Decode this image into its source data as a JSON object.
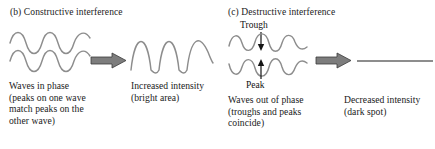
{
  "figure": {
    "panels": [
      {
        "id": "constructive",
        "title": "(b) Constructive interference",
        "input_caption": [
          "Waves in phase",
          "(peaks on one wave",
          "match peaks on the",
          "other wave)"
        ],
        "output_caption": [
          "Increased intensity",
          "(bright area)"
        ],
        "arrow": "right-arrow",
        "annotations": []
      },
      {
        "id": "destructive",
        "title": "(c) Destructive interference",
        "input_caption": [
          "Waves out of phase",
          "(troughs and peaks",
          "coincide)"
        ],
        "output_caption": [
          "Decreased intensity",
          "(dark spot)"
        ],
        "arrow": "right-arrow",
        "annotations": [
          {
            "label": "Trough",
            "target": "upper-wave-trough"
          },
          {
            "label": "Peak",
            "target": "lower-wave-peak"
          }
        ]
      }
    ],
    "colors": {
      "wave_stroke": "#8d8d8d",
      "arrow_fill": "#7d7d7d",
      "arrow_stroke": "#3a3a3a",
      "text": "#1a1a1a",
      "background": "#ffffff"
    }
  }
}
